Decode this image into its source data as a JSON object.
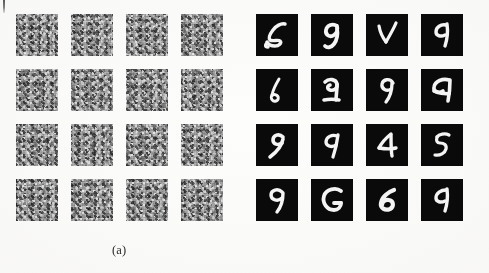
{
  "figure": {
    "background_color": "#fdfdfc",
    "panels": [
      {
        "id": "a",
        "caption": "(a)",
        "kind": "noise-patch-grid",
        "rows": 4,
        "columns": 4,
        "tile_count": 16,
        "tile_background_color": "#9a9a9a",
        "description": "random grayscale noise texture patches"
      },
      {
        "id": "b",
        "caption": "(b)",
        "kind": "handwritten-digit-grid",
        "rows": 4,
        "columns": 4,
        "tile_count": 16,
        "tile_background_color": "#0a0a0a",
        "stroke_color": "#f4f4f4",
        "description": "handwritten digit samples, white strokes on black"
      }
    ]
  },
  "noise_tiles": [
    {
      "index": 1,
      "row": 1,
      "col": 1
    },
    {
      "index": 2,
      "row": 1,
      "col": 2
    },
    {
      "index": 3,
      "row": 1,
      "col": 3
    },
    {
      "index": 4,
      "row": 1,
      "col": 4
    },
    {
      "index": 5,
      "row": 2,
      "col": 1
    },
    {
      "index": 6,
      "row": 2,
      "col": 2
    },
    {
      "index": 7,
      "row": 2,
      "col": 3
    },
    {
      "index": 8,
      "row": 2,
      "col": 4
    },
    {
      "index": 9,
      "row": 3,
      "col": 1
    },
    {
      "index": 10,
      "row": 3,
      "col": 2
    },
    {
      "index": 11,
      "row": 3,
      "col": 3
    },
    {
      "index": 12,
      "row": 3,
      "col": 4
    },
    {
      "index": 13,
      "row": 4,
      "col": 1
    },
    {
      "index": 14,
      "row": 4,
      "col": 2
    },
    {
      "index": 15,
      "row": 4,
      "col": 3
    },
    {
      "index": 16,
      "row": 4,
      "col": 4
    }
  ],
  "digit_tiles": [
    {
      "index": 1,
      "row": 1,
      "col": 1,
      "digit": "5"
    },
    {
      "index": 2,
      "row": 1,
      "col": 2,
      "digit": "9"
    },
    {
      "index": 3,
      "row": 1,
      "col": 3,
      "digit": "4"
    },
    {
      "index": 4,
      "row": 1,
      "col": 4,
      "digit": "4"
    },
    {
      "index": 5,
      "row": 2,
      "col": 1,
      "digit": "6"
    },
    {
      "index": 6,
      "row": 2,
      "col": 2,
      "digit": "2"
    },
    {
      "index": 7,
      "row": 2,
      "col": 3,
      "digit": "9"
    },
    {
      "index": 8,
      "row": 2,
      "col": 4,
      "digit": "4"
    },
    {
      "index": 9,
      "row": 3,
      "col": 1,
      "digit": "9"
    },
    {
      "index": 10,
      "row": 3,
      "col": 2,
      "digit": "9"
    },
    {
      "index": 11,
      "row": 3,
      "col": 3,
      "digit": "4"
    },
    {
      "index": 12,
      "row": 3,
      "col": 4,
      "digit": "5"
    },
    {
      "index": 13,
      "row": 4,
      "col": 1,
      "digit": "9"
    },
    {
      "index": 14,
      "row": 4,
      "col": 2,
      "digit": "6"
    },
    {
      "index": 15,
      "row": 4,
      "col": 3,
      "digit": "6"
    },
    {
      "index": 16,
      "row": 4,
      "col": 4,
      "digit": "4"
    }
  ],
  "artifacts": {
    "scan_mark": "dark vertical scanner streak at top-left margin"
  }
}
